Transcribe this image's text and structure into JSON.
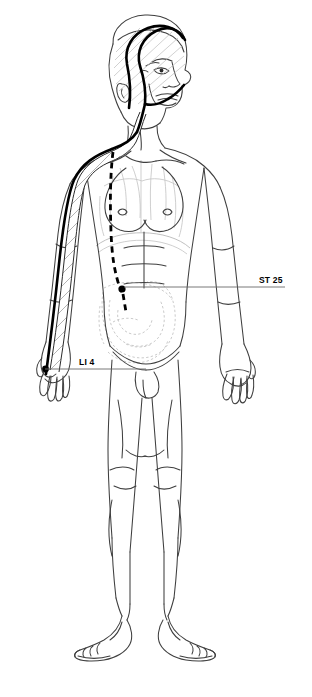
{
  "illustration": {
    "title": "Acupuncture meridian figure",
    "subject": "standing male anatomical figure, anterior view",
    "background_color": "#ffffff",
    "line_color": "#4a4a4a",
    "meridian_color": "#000000",
    "faint_color": "#b9b9b9"
  },
  "labels": [
    {
      "id": "st25",
      "text": "ST 25",
      "point_name": "ST 25",
      "marker": "filled-dot",
      "leader": "horizontal line to abdomen point",
      "x": 259,
      "y": 275
    },
    {
      "id": "li4",
      "text": "LI 4",
      "point_name": "LI 4",
      "marker": "filled-dot",
      "leader": "horizontal line to left hand",
      "x": 79,
      "y": 357
    }
  ],
  "meridians": [
    {
      "name": "large-intestine-channel",
      "style": "solid-hatched-band",
      "path": "left hand to shoulder, neck, jaw, over scalp to nose"
    },
    {
      "name": "stomach-channel",
      "style": "dashed",
      "path": "clavicle down chest and abdomen to ST 25"
    }
  ]
}
